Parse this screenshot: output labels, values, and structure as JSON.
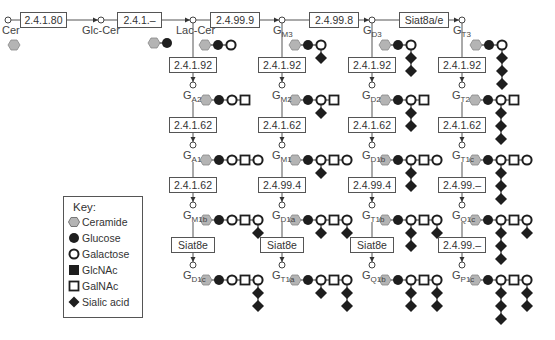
{
  "colors": {
    "ceramide": "#b4b4b4",
    "glucose": "#1e1e1e",
    "galactose": "#ffffff",
    "glcnac": "#1e1e1e",
    "galnac": "#ffffff",
    "sialic": "#1e1e1e",
    "stroke": "#1e1e1e",
    "line": "#555555"
  },
  "top_row": {
    "nodes": [
      {
        "id": "cer",
        "label": "Cer",
        "x": 8,
        "glycan": [
          "ceramide"
        ]
      },
      {
        "id": "glc-cer",
        "label": "Glc-Cer",
        "x": 101,
        "glycan": [
          "ceramide",
          "glucose"
        ]
      },
      {
        "id": "lac-cer",
        "label": "Lac-Cer",
        "x": 193,
        "glycan": [
          "ceramide",
          "glucose",
          "galactose"
        ]
      },
      {
        "id": "gm3",
        "label": "G",
        "sub": "M3",
        "x": 282
      },
      {
        "id": "gd3",
        "label": "G",
        "sub": "D3",
        "x": 372
      },
      {
        "id": "gt3",
        "label": "G",
        "sub": "T3",
        "x": 462
      }
    ],
    "enzymes": [
      {
        "label": "2.4.1.80",
        "x": 20,
        "w": 47
      },
      {
        "label": "2.4.1.–",
        "x": 117,
        "w": 45
      },
      {
        "label": "2.4.99.9",
        "x": 210,
        "w": 50
      },
      {
        "label": "2.4.99.8",
        "x": 309,
        "w": 50
      },
      {
        "label": "Siat8a/e",
        "x": 399,
        "w": 50
      }
    ]
  },
  "columns": [
    {
      "x": 193,
      "enzymes": [
        "2.4.1.92",
        "2.4.1.62",
        "2.4.1.62",
        "Siat8e"
      ],
      "gangliosides": [
        {
          "name": "G",
          "sub": "A2"
        },
        {
          "name": "G",
          "sub": "A1"
        },
        {
          "name": "G",
          "sub": "M1b"
        },
        {
          "name": "G",
          "sub": "D1c"
        }
      ]
    },
    {
      "x": 282,
      "enzymes": [
        "2.4.1.92",
        "2.4.1.62",
        "2.4.99.4",
        "Siat8e"
      ],
      "gangliosides": [
        {
          "name": "G",
          "sub": "M2"
        },
        {
          "name": "G",
          "sub": "M1"
        },
        {
          "name": "G",
          "sub": "D1a"
        },
        {
          "name": "G",
          "sub": "T1a"
        }
      ]
    },
    {
      "x": 372,
      "enzymes": [
        "2.4.1.92",
        "2.4.1.62",
        "2.4.99.4",
        "Siat8e"
      ],
      "gangliosides": [
        {
          "name": "G",
          "sub": "D2"
        },
        {
          "name": "G",
          "sub": "D1b"
        },
        {
          "name": "G",
          "sub": "T1b"
        },
        {
          "name": "G",
          "sub": "Q1b"
        }
      ]
    },
    {
      "x": 462,
      "enzymes": [
        "2.4.1.92",
        "2.4.1.62",
        "2.4.99.–",
        "2.4.99.–"
      ],
      "gangliosides": [
        {
          "name": "G",
          "sub": "T2"
        },
        {
          "name": "G",
          "sub": "T1c"
        },
        {
          "name": "G",
          "sub": "Q1c"
        },
        {
          "name": "G",
          "sub": "P1c"
        }
      ]
    }
  ],
  "legend": {
    "title": "Key:",
    "items": [
      {
        "shape": "ceramide",
        "label": "Ceramide"
      },
      {
        "shape": "glucose",
        "label": "Glucose"
      },
      {
        "shape": "galactose",
        "label": "Galactose"
      },
      {
        "shape": "glcnac",
        "label": "GlcNAc"
      },
      {
        "shape": "galnac",
        "label": "GalNAc"
      },
      {
        "shape": "sialic",
        "label": "Sialic acid"
      }
    ]
  }
}
